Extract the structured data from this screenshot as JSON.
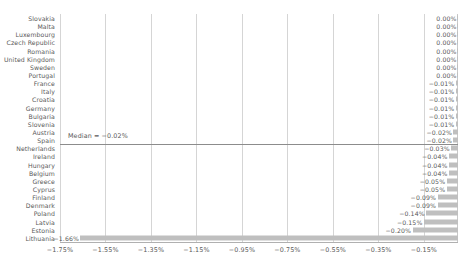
{
  "chart_data": {
    "type": "bar",
    "orientation": "horizontal",
    "title": "",
    "subtitle": "",
    "xlabel": "",
    "ylabel": "",
    "xlim": [
      -1.75,
      0.0
    ],
    "xticks": [
      "-1.75%",
      "-1.55%",
      "-1.35%",
      "-1.15%",
      "-0.95%",
      "-0.75%",
      "-0.55%",
      "-0.35%",
      "-0.15%"
    ],
    "xtick_values": [
      -1.75,
      -1.55,
      -1.35,
      -1.15,
      -0.95,
      -0.75,
      -0.55,
      -0.35,
      -0.15
    ],
    "grid": true,
    "grid_axis": "x",
    "legend": false,
    "bar_color": "#bfbfbf",
    "grid_color": "#d5d5d5",
    "text_color": "#595959",
    "categories": [
      "Slovakia",
      "Malta",
      "Luxembourg",
      "Czech Republic",
      "Romania",
      "United Kingdom",
      "Sweden",
      "Portugal",
      "France",
      "Italy",
      "Croatia",
      "Germany",
      "Bulgaria",
      "Slovenia",
      "Austria",
      "Spain",
      "Netherlands",
      "Ireland",
      "Hungary",
      "Belgium",
      "Greece",
      "Cyprus",
      "Finland",
      "Denmark",
      "Poland",
      "Latvia",
      "Estonia",
      "Lithuania"
    ],
    "values": [
      0.0,
      0.0,
      0.0,
      0.0,
      0.0,
      0.0,
      0.0,
      0.0,
      -0.01,
      -0.01,
      -0.01,
      -0.01,
      -0.01,
      -0.01,
      -0.02,
      -0.02,
      -0.03,
      -0.04,
      -0.04,
      -0.04,
      -0.05,
      -0.05,
      -0.09,
      -0.09,
      -0.14,
      -0.15,
      -0.2,
      -1.66
    ],
    "value_labels": [
      "0.00%",
      "0.00%",
      "0.00%",
      "0.00%",
      "0.00%",
      "0.00%",
      "0.00%",
      "0.00%",
      "-0.01%",
      "-0.01%",
      "-0.01%",
      "-0.01%",
      "-0.01%",
      "-0.01%",
      "-0.02%",
      "-0.02%",
      "-0.03%",
      "-0.04%",
      "-0.04%",
      "-0.04%",
      "-0.05%",
      "-0.05%",
      "-0.09%",
      "-0.09%",
      "-0.14%",
      "-0.15%",
      "-0.20%",
      "-1.66%"
    ],
    "annotations": [
      {
        "name": "median-line",
        "label": "Median = -0.02%",
        "value": -0.02,
        "after_category": "Spain"
      }
    ]
  }
}
